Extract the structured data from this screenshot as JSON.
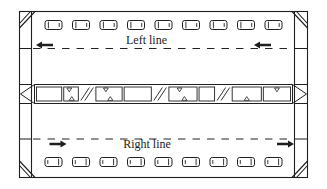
{
  "figure": {
    "kind": "tunnel-traffic-scheme-diagram",
    "background": "#ffffff",
    "ink_color": "#1f1f1f"
  },
  "lanes": {
    "left": {
      "label": "Left line",
      "direction": "left",
      "vehicles": 9,
      "arrows": 2
    },
    "right": {
      "label": "Right line",
      "direction": "right",
      "vehicles": 9,
      "arrows": 2
    }
  },
  "median": {
    "segments": [
      {
        "kind": "cell",
        "w": 26
      },
      {
        "kind": "cell",
        "w": 15,
        "top_symbol": true,
        "bottom_symbol": true
      },
      {
        "kind": "slash",
        "w": 14
      },
      {
        "kind": "cell",
        "w": 27,
        "top_symbol": true,
        "bottom_symbol": true
      },
      {
        "kind": "cell",
        "w": 28
      },
      {
        "kind": "slash",
        "w": 14
      },
      {
        "kind": "cell",
        "w": 29,
        "top_symbol": true,
        "bottom_symbol": true
      },
      {
        "kind": "cell",
        "w": 16
      },
      {
        "kind": "slash",
        "w": 14
      },
      {
        "kind": "cell",
        "w": 30,
        "bottom_symbol": true
      },
      {
        "kind": "cell",
        "w": 28,
        "top_symbol": true
      }
    ]
  }
}
